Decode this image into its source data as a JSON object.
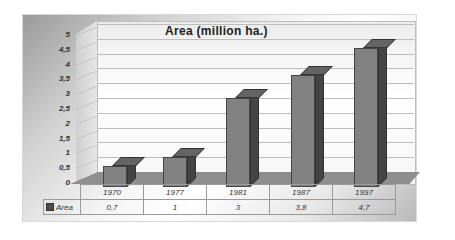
{
  "chart_data": {
    "type": "bar",
    "style": "3d-column",
    "title": "Area (million ha.)",
    "xlabel": "",
    "ylabel": "",
    "categories": [
      "1970",
      "1977",
      "1981",
      "1987",
      "1997"
    ],
    "series": [
      {
        "name": "Area",
        "values": [
          0.7,
          1,
          3,
          3.8,
          4.7
        ]
      }
    ],
    "ylim": [
      0,
      5
    ],
    "y_ticks": [
      "0",
      "0,5",
      "1",
      "1,5",
      "2",
      "2,5",
      "3",
      "3,5",
      "4",
      "4,5",
      "5"
    ],
    "grid": true,
    "legend_position": "data-table",
    "data_table": {
      "header": [
        "1970",
        "1977",
        "1981",
        "1987",
        "1997"
      ],
      "rows": [
        {
          "label": "Area",
          "values": [
            "0,7",
            "1",
            "3",
            "3,8",
            "4,7"
          ]
        }
      ]
    }
  },
  "colors": {
    "bar_front": "#8d8d8d",
    "bar_side": "#4c4c4c",
    "bar_top": "#707070",
    "floor": "#8e8e8e",
    "gridline": "#bdbdbd"
  }
}
